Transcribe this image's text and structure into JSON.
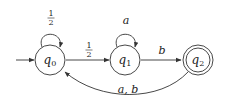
{
  "diagram": {
    "type": "finite-automaton",
    "colors": {
      "stroke": "#333333",
      "text": "#222222",
      "background": "#ffffff"
    },
    "states": [
      {
        "id": "q0",
        "name": "q",
        "subscript": "0",
        "initial": true,
        "accepting": false
      },
      {
        "id": "q1",
        "name": "q",
        "subscript": "1",
        "initial": false,
        "accepting": false
      },
      {
        "id": "q2",
        "name": "q",
        "subscript": "2",
        "initial": false,
        "accepting": true
      }
    ],
    "transitions": [
      {
        "from": "q0",
        "to": "q0",
        "label_num": "1",
        "label_den": "2"
      },
      {
        "from": "q0",
        "to": "q1",
        "label_num": "1",
        "label_den": "2"
      },
      {
        "from": "q1",
        "to": "q1",
        "label": "a"
      },
      {
        "from": "q1",
        "to": "q2",
        "label": "b"
      },
      {
        "from": "q2",
        "to": "q0",
        "label": "a, b"
      }
    ]
  }
}
